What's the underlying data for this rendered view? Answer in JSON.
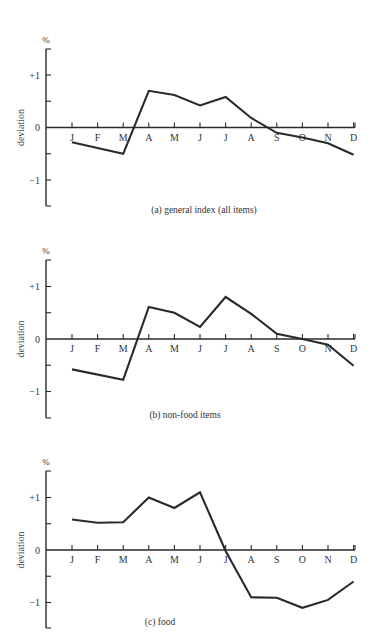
{
  "chart_data": [
    {
      "type": "line",
      "title": "(a)  general index (all items)",
      "xlabel": "",
      "ylabel": "deviation",
      "unit_label": "%",
      "categories": [
        "J",
        "F",
        "M",
        "A",
        "M",
        "J",
        "J",
        "A",
        "S",
        "O",
        "N",
        "D"
      ],
      "series": [
        {
          "name": "general index (all items)",
          "values": [
            -0.28,
            null,
            -0.5,
            0.7,
            0.62,
            0.42,
            0.58,
            0.18,
            -0.1,
            -0.19,
            -0.3,
            -0.52
          ]
        }
      ],
      "yticks": [
        "+1",
        "0",
        "-1"
      ],
      "ylim": [
        -1.5,
        1.5
      ],
      "grid": false,
      "legend": "none"
    },
    {
      "type": "line",
      "title": "(b)  non-food items",
      "xlabel": "",
      "ylabel": "deviation",
      "unit_label": "%",
      "categories": [
        "J",
        "F",
        "M",
        "A",
        "M",
        "J",
        "J",
        "A",
        "S",
        "O",
        "N",
        "D"
      ],
      "series": [
        {
          "name": "non-food items",
          "values": [
            -0.58,
            null,
            -0.78,
            0.61,
            0.5,
            0.23,
            0.8,
            0.48,
            0.1,
            0.0,
            -0.11,
            -0.51
          ]
        }
      ],
      "yticks": [
        "+1",
        "0",
        "-1"
      ],
      "ylim": [
        -1.5,
        1.5
      ],
      "grid": false,
      "legend": "none"
    },
    {
      "type": "line",
      "title": "(c)  food",
      "xlabel": "",
      "ylabel": "deviation",
      "unit_label": "%",
      "categories": [
        "J",
        "F",
        "M",
        "A",
        "M",
        "J",
        "J",
        "A",
        "S",
        "O",
        "N",
        "D"
      ],
      "series": [
        {
          "name": "food",
          "values": [
            0.58,
            0.52,
            0.53,
            1.0,
            0.8,
            1.1,
            -0.02,
            -0.9,
            -0.91,
            -1.1,
            -0.95,
            -0.6
          ]
        }
      ],
      "yticks": [
        "+1",
        "0",
        "-1"
      ],
      "ylim": [
        -1.5,
        1.5
      ],
      "grid": false,
      "legend": "none"
    }
  ],
  "panels": [
    {
      "caption": "(a)  general index (all items)",
      "unit": "%",
      "ylabel": "deviation",
      "tick_plus": "+1",
      "tick_zero": "0",
      "tick_minus": "−1"
    },
    {
      "caption": "(b)  non-food items",
      "unit": "%",
      "ylabel": "deviation",
      "tick_plus": "+1",
      "tick_zero": "0",
      "tick_minus": "−1"
    },
    {
      "caption": "(c)  food",
      "unit": "%",
      "ylabel": "deviation",
      "tick_plus": "+1",
      "tick_zero": "0",
      "tick_minus": "−1"
    }
  ],
  "months": [
    "J",
    "F",
    "M",
    "A",
    "M",
    "J",
    "J",
    "A",
    "S",
    "O",
    "N",
    "D"
  ]
}
